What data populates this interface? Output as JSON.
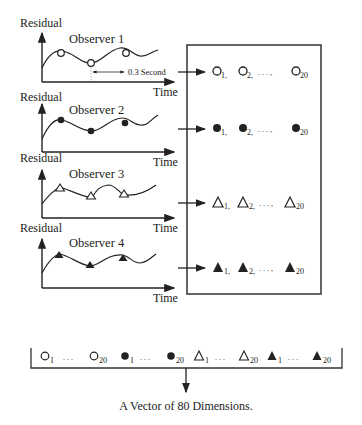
{
  "observers": [
    {
      "title": "Observer 1",
      "ylabel": "Residual",
      "xlabel": "Time",
      "marker": "open-circle",
      "annotation": "0.3 Second"
    },
    {
      "title": "Observer 2",
      "ylabel": "Residual",
      "xlabel": "Time",
      "marker": "filled-circle"
    },
    {
      "title": "Observer 3",
      "ylabel": "Residual",
      "xlabel": "Time",
      "marker": "open-triangle"
    },
    {
      "title": "Observer 4",
      "ylabel": "Residual",
      "xlabel": "Time",
      "marker": "filled-triangle"
    }
  ],
  "box_rows": [
    {
      "marker": "open-circle",
      "s1": "1,",
      "s2": "2,",
      "dots": ". . . ,",
      "s3": "20"
    },
    {
      "marker": "filled-circle",
      "s1": "1,",
      "s2": "2,",
      "dots": ". . . ,",
      "s3": "20"
    },
    {
      "marker": "open-triangle",
      "s1": "1,",
      "s2": "2,",
      "dots": ". . . ,",
      "s3": "20"
    },
    {
      "marker": "filled-triangle",
      "s1": "1,",
      "s2": "2,",
      "dots": ". . . ,",
      "s3": "20"
    }
  ],
  "vector": {
    "first_sub": "1",
    "last_sub": "20",
    "dots": ". . .",
    "caption": "A Vector of 80 Dimensions."
  },
  "colors": {
    "ink": "#222222",
    "background": "#ffffff"
  }
}
